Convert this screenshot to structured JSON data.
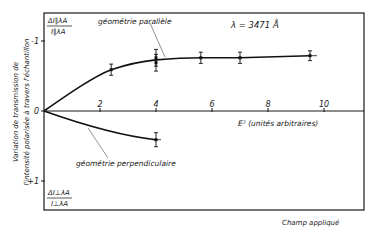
{
  "chart_data": {
    "type": "line",
    "title": "",
    "annotation_wavelength": "λ = 3471 Å",
    "xlabel": "E² (unités arbitraires)",
    "ylabel_line1": "Variation de transmission de",
    "ylabel_line2": "l'intensité polarisée à travers l'échantillon",
    "ylabel_top_fraction": {
      "num": "ΔI∥λA",
      "den": "I∥λA"
    },
    "ylabel_bottom_fraction": {
      "num": "ΔI⊥λA",
      "den": "I⊥λA"
    },
    "footer_label": "Champ appliqué",
    "xlim": [
      0,
      12
    ],
    "ylim": [
      -1.4,
      1.4
    ],
    "y_inverted": true,
    "x_ticks": [
      2,
      4,
      6,
      8,
      10
    ],
    "x_tick_labels": [
      "2",
      "4",
      "6",
      "8",
      "10"
    ],
    "y_ticks": [
      -1,
      0,
      1
    ],
    "y_tick_labels": [
      "-1",
      "0",
      "+1"
    ],
    "grid": false,
    "series": [
      {
        "name": "géométrie parallèle",
        "x": [
          0,
          2.4,
          4.0,
          4.0,
          5.6,
          7.0,
          9.5
        ],
        "values": [
          0,
          -0.59,
          -0.69,
          -0.76,
          -0.76,
          -0.76,
          -0.79
        ],
        "error": [
          0,
          0.08,
          0.12,
          0.12,
          0.08,
          0.08,
          0.07
        ]
      },
      {
        "name": "géométrie perpendiculaire",
        "x": [
          0,
          4.0
        ],
        "values": [
          0,
          0.41
        ],
        "error": [
          0,
          0.1
        ]
      }
    ]
  }
}
